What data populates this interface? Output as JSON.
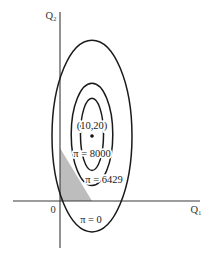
{
  "chart_data": {
    "type": "line",
    "subtype": "iso-profit contours",
    "title": "",
    "xlabel": "Q₁",
    "ylabel": "Q₂",
    "origin_label": "0",
    "xlim": [
      -14.5,
      43.5
    ],
    "ylim": [
      -14.5,
      58
    ],
    "grid": false,
    "legend": "none",
    "optimum": {
      "x": 10,
      "y": 20,
      "label": "(10,20)"
    },
    "contours": [
      {
        "name": "π = 0",
        "level": 0,
        "center": [
          10,
          20
        ],
        "semi_axes": [
          12.5,
          29.5
        ],
        "label": "π = 0"
      },
      {
        "name": "π = 6429",
        "level": 6429,
        "center": [
          10,
          20.5
        ],
        "semi_axes": [
          6.5,
          15.7
        ],
        "label": "π = 6429"
      },
      {
        "name": "π = 8000",
        "level": 8000,
        "center": [
          10,
          20.5
        ],
        "semi_axes": [
          3.6,
          11.1
        ],
        "label": "π = 8000"
      }
    ],
    "feasible_region": {
      "label": "shaded constraint region",
      "vertices": [
        [
          0,
          0
        ],
        [
          0,
          16.3
        ],
        [
          10,
          0
        ]
      ],
      "color": "#bdbdbd"
    }
  }
}
